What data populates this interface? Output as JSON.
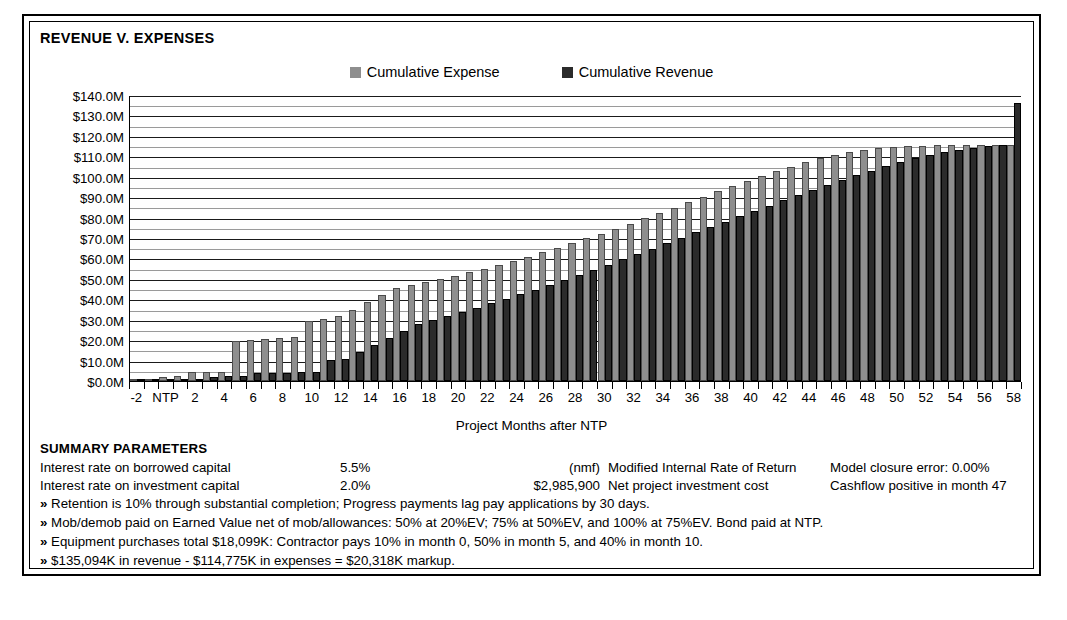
{
  "chart_data": {
    "type": "bar",
    "title": "REVENUE V. EXPENSES",
    "xlabel": "Project Months after NTP",
    "ylabel": "",
    "ylim": [
      0,
      140
    ],
    "ytick_labels": [
      "$0.0M",
      "$10.0M",
      "$20.0M",
      "$30.0M",
      "$40.0M",
      "$50.0M",
      "$60.0M",
      "$70.0M",
      "$80.0M",
      "$90.0M",
      "$100.0M",
      "$110.0M",
      "$120.0M",
      "$130.0M",
      "$140.0M"
    ],
    "ytick_values": [
      0,
      10,
      20,
      30,
      40,
      50,
      60,
      70,
      80,
      90,
      100,
      110,
      120,
      130,
      140
    ],
    "minor_gridline_step": 5,
    "grid": true,
    "legend_position": "top-center",
    "categories": [
      "-2",
      "-1",
      "NTP",
      "1",
      "2",
      "3",
      "4",
      "5",
      "6",
      "7",
      "8",
      "9",
      "10",
      "11",
      "12",
      "13",
      "14",
      "15",
      "16",
      "17",
      "18",
      "19",
      "20",
      "21",
      "22",
      "23",
      "24",
      "25",
      "26",
      "27",
      "28",
      "29",
      "30",
      "31",
      "32",
      "33",
      "34",
      "35",
      "36",
      "37",
      "38",
      "39",
      "40",
      "41",
      "42",
      "43",
      "44",
      "45",
      "46",
      "47",
      "48",
      "49",
      "50",
      "51",
      "52",
      "53",
      "54",
      "55",
      "56",
      "57",
      "58"
    ],
    "xtick_labels": [
      "-2",
      "NTP",
      "2",
      "4",
      "6",
      "8",
      "10",
      "12",
      "14",
      "16",
      "18",
      "20",
      "22",
      "24",
      "26",
      "28",
      "30",
      "32",
      "34",
      "36",
      "38",
      "40",
      "42",
      "44",
      "46",
      "48",
      "50",
      "52",
      "54",
      "56",
      "58"
    ],
    "series": [
      {
        "name": "Cumulative Expense",
        "color": "#8e8e8e",
        "values": [
          0.0,
          0.0,
          1.1,
          1.4,
          3.2,
          3.3,
          3.4,
          18.4,
          19.0,
          19.6,
          20.2,
          20.8,
          28.6,
          29.6,
          30.7,
          34.0,
          37.5,
          41.0,
          44.5,
          46.0,
          47.5,
          49.0,
          50.5,
          52.3,
          54.0,
          55.8,
          57.8,
          59.8,
          62.0,
          64.2,
          66.5,
          68.8,
          71.2,
          73.6,
          76.0,
          78.6,
          81.2,
          83.8,
          86.5,
          89.2,
          91.8,
          94.4,
          97.0,
          99.5,
          101.8,
          104.0,
          106.0,
          108.0,
          109.6,
          111.0,
          112.2,
          113.0,
          113.6,
          114.0,
          114.3,
          114.5,
          114.6,
          114.7,
          114.75,
          114.775,
          114.775
        ]
      },
      {
        "name": "Cumulative Revenue",
        "color": "#2b2b2b",
        "values": [
          0.0,
          0.0,
          0.0,
          0.0,
          0.0,
          1.2,
          1.3,
          1.4,
          2.9,
          3.0,
          3.1,
          3.2,
          3.3,
          9.4,
          9.6,
          13.0,
          16.5,
          20.0,
          23.5,
          27.0,
          29.0,
          31.0,
          33.0,
          35.0,
          37.0,
          39.2,
          41.5,
          43.8,
          46.2,
          48.6,
          51.0,
          53.5,
          56.0,
          58.6,
          61.2,
          63.8,
          66.5,
          69.2,
          71.8,
          74.4,
          77.0,
          79.6,
          82.2,
          84.8,
          87.4,
          90.0,
          92.5,
          95.0,
          97.4,
          99.8,
          102.0,
          104.2,
          106.2,
          108.0,
          109.6,
          111.0,
          112.2,
          113.2,
          114.0,
          114.6,
          135.094
        ]
      }
    ]
  },
  "legend": {
    "items": [
      {
        "label": "Cumulative Expense",
        "color": "#8e8e8e"
      },
      {
        "label": "Cumulative Revenue",
        "color": "#2b2b2b"
      }
    ]
  },
  "summary": {
    "heading": "SUMMARY PARAMETERS",
    "rows": [
      {
        "label": "Interest rate on borrowed capital",
        "value": "5.5%",
        "mid_value": "(nmf)",
        "mid_label": "Modified Internal Rate of Return",
        "right": "Model closure error: 0.00%"
      },
      {
        "label": "Interest rate on investment capital",
        "value": "2.0%",
        "mid_value": "$2,985,900",
        "mid_label": "Net project investment cost",
        "right": "Cashflow positive in month 47"
      }
    ],
    "bullet": "»",
    "notes": [
      "Retention is 10% through substantial completion; Progress payments lag pay applications by 30 days.",
      "Mob/demob paid on Earned Value net of mob/allowances: 50% at 20%EV; 75% at 50%EV, and 100% at 75%EV.  Bond paid at NTP.",
      "Equipment purchases total $18,099K: Contractor pays 10% in month 0, 50% in month 5, and 40% in month 10.",
      "$135,094K in revenue - $114,775K in expenses = $20,318K markup."
    ]
  }
}
